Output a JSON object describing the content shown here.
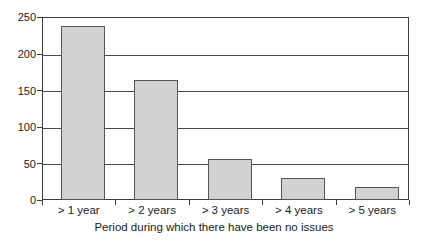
{
  "chart_data": {
    "type": "bar",
    "title": "",
    "subtitle": "",
    "xlabel": "Period during which there have been no issues",
    "ylabel": "",
    "categories": [
      "> 1 year",
      "> 2 years",
      "> 3 years",
      "> 4 years",
      "> 5 years"
    ],
    "values": [
      238,
      164,
      56,
      30,
      18
    ],
    "ylim": [
      0,
      250
    ],
    "ytick_labels": [
      "0",
      "50",
      "100",
      "150",
      "200",
      "250"
    ],
    "ytick_values": [
      0,
      50,
      100,
      150,
      200,
      250
    ],
    "grid": true,
    "legend": null,
    "legend_position": "none",
    "bar_fill_color": "#d2d2d2",
    "bar_border_color": "#555555",
    "axis_color": "#3c3c3c",
    "gridline_color": "#4a4a4a",
    "background_color": "#ffffff",
    "annotations": []
  }
}
